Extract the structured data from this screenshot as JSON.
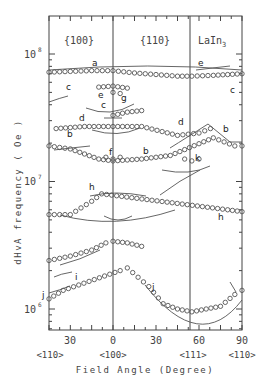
{
  "chart_data": {
    "type": "scatter",
    "title": "LaIn3",
    "xlabel": "Field Angle (Degree)",
    "ylabel": "dHvA frequency ( Oe )",
    "yscale": "log",
    "ylim": [
      600000,
      170000000
    ],
    "y_ticks": [
      {
        "label": "10",
        "exp": "8",
        "value": 100000000
      },
      {
        "label": "10",
        "exp": "7",
        "value": 10000000
      },
      {
        "label": "10",
        "exp": "6",
        "value": 1000000
      }
    ],
    "x_ticks": [
      {
        "label": "30",
        "angle_plane": "{100}",
        "deg": 15
      },
      {
        "label": "0",
        "angle_plane": "<100>",
        "deg": 0
      },
      {
        "label": "30",
        "angle_plane": "{110}",
        "deg": 30
      },
      {
        "label": "60",
        "angle_plane": "{110}",
        "deg": 60
      },
      {
        "label": "90",
        "angle_plane": "{110}",
        "deg": 90
      }
    ],
    "direction_labels": [
      "<110>",
      "<100>",
      "<111>",
      "<110>"
    ],
    "plane_labels": [
      "{100}",
      "{110}"
    ],
    "grid": false,
    "legend": "none",
    "branch_labels": [
      "a",
      "b",
      "c",
      "d",
      "e",
      "f",
      "g",
      "h",
      "i",
      "j",
      "k"
    ],
    "series": [
      {
        "name": "a",
        "points_deg_freq": [
          [
            -45,
            72000000.0
          ],
          [
            -30,
            73000000.0
          ],
          [
            -15,
            74000000.0
          ],
          [
            0,
            74000000.0
          ],
          [
            15,
            71000000.0
          ],
          [
            30,
            69000000.0
          ],
          [
            45,
            67000000.0
          ],
          [
            55,
            67000000.0
          ],
          [
            70,
            68000000.0
          ],
          [
            90,
            70000000.0
          ]
        ]
      },
      {
        "name": "e",
        "points_deg_freq": [
          [
            -10,
            55000000.0
          ],
          [
            0,
            56000000.0
          ],
          [
            10,
            54000000.0
          ]
        ]
      },
      {
        "name": "g",
        "points_deg_freq": [
          [
            0,
            50000000.0
          ],
          [
            5,
            49000000.0
          ]
        ]
      },
      {
        "name": "c",
        "points_deg_freq": [
          [
            0,
            33000000.0
          ],
          [
            10,
            35000000.0
          ],
          [
            20,
            36000000.0
          ]
        ]
      },
      {
        "name": "d",
        "points_deg_freq": [
          [
            -40,
            26000000.0
          ],
          [
            -20,
            27000000.0
          ],
          [
            0,
            27000000.0
          ],
          [
            20,
            27000000.0
          ],
          [
            45,
            23000000.0
          ],
          [
            60,
            24000000.0
          ],
          [
            68,
            26000000.0
          ]
        ]
      },
      {
        "name": "b",
        "points_deg_freq": [
          [
            -45,
            19000000.0
          ],
          [
            -30,
            18000000.0
          ],
          [
            -10,
            15000000.0
          ],
          [
            0,
            14500000.0
          ],
          [
            20,
            15000000.0
          ],
          [
            40,
            16000000.0
          ],
          [
            70,
            22000000.0
          ],
          [
            85,
            19000000.0
          ],
          [
            90,
            19000000.0
          ]
        ]
      },
      {
        "name": "f",
        "points_deg_freq": [
          [
            -5,
            15500000.0
          ],
          [
            0,
            15000000.0
          ],
          [
            5,
            15500000.0
          ]
        ]
      },
      {
        "name": "k",
        "points_deg_freq": [
          [
            50,
            15000000.0
          ],
          [
            55,
            14500000.0
          ],
          [
            60,
            15000000.0
          ]
        ]
      },
      {
        "name": "h",
        "points_deg_freq": [
          [
            -45,
            5500000.0
          ],
          [
            -30,
            5500000.0
          ],
          [
            -15,
            7000000.0
          ],
          [
            -8,
            8000000.0
          ],
          [
            80,
            6000000.0
          ],
          [
            90,
            5800000.0
          ]
        ]
      },
      {
        "name": "i",
        "points_deg_freq": [
          [
            -45,
            2400000.0
          ],
          [
            -30,
            2600000.0
          ],
          [
            -15,
            2900000.0
          ],
          [
            -5,
            3300000.0
          ],
          [
            0,
            3400000.0
          ],
          [
            10,
            3300000.0
          ],
          [
            20,
            3100000.0
          ]
        ]
      },
      {
        "name": "j",
        "points_deg_freq": [
          [
            -45,
            1200000.0
          ],
          [
            -35,
            1400000.0
          ],
          [
            5,
            2000000.0
          ],
          [
            10,
            2100000.0
          ],
          [
            25,
            1500000.0
          ],
          [
            35,
            1100000.0
          ],
          [
            45,
            1000000.0
          ],
          [
            55,
            950000.0
          ],
          [
            65,
            1000000.0
          ],
          [
            75,
            1050000.0
          ],
          [
            85,
            1300000.0
          ],
          [
            90,
            1400000.0
          ]
        ]
      }
    ]
  }
}
